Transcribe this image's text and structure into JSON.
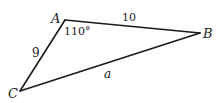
{
  "diagram": {
    "type": "triangle",
    "vertices": {
      "A": {
        "label": "A"
      },
      "B": {
        "label": "B"
      },
      "C": {
        "label": "C"
      }
    },
    "sides": {
      "AB": {
        "label": "10"
      },
      "AC": {
        "label": "9"
      },
      "BC": {
        "label": "a"
      }
    },
    "angles": {
      "A": {
        "label": "110°"
      }
    },
    "colors": {
      "stroke": "#1a1a1a",
      "text": "#222222",
      "background": "#ffffff"
    }
  }
}
